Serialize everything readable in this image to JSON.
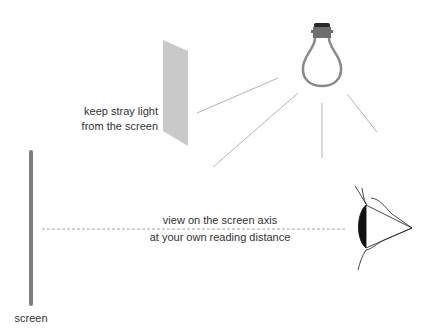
{
  "labels": {
    "shade_note_line1": "keep stray light",
    "shade_note_line2": "from the screen",
    "view_note_line1": "view on the screen axis",
    "view_note_line2": "at your own reading distance",
    "screen": "screen"
  },
  "icons": {
    "lamp": "light-bulb",
    "shade": "light-shield-panel",
    "eye": "eye-side-view",
    "screen": "screen-edge-bar"
  },
  "colors": {
    "background": "#ffffff",
    "screen_bar": "#7d7d7d",
    "shade_panel": "#c8c8c8",
    "rays": "#b4b4b4",
    "bulb_glass": "#8a8a8a",
    "bulb_cap": "#6a6a6a",
    "eye_cornea": "#111111",
    "text": "#333333",
    "dashed_axis": "#a8a8a8"
  }
}
